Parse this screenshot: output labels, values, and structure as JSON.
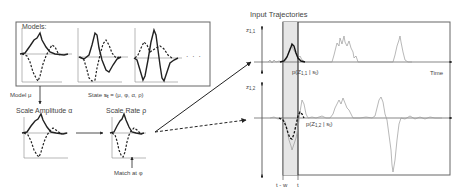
{
  "figure": {
    "type": "model-matching diagram",
    "models_box": {
      "title": "Models:",
      "ellipsis": "· · ·",
      "panels": [
        {
          "id": "model-1",
          "solid": "single positive peak",
          "dashed": "single negative trough with small positive bump"
        },
        {
          "id": "model-2",
          "solid": "positive peak then negative trough",
          "dashed": "negative trough then positive peak"
        },
        {
          "id": "model-3",
          "solid": "oscillating positive/negative peaks",
          "dashed": "broad positive hump"
        }
      ]
    },
    "labels": {
      "model_mu": "Model μ",
      "state": "State",
      "state_symbol": "s",
      "state_sub": "t",
      "state_tuple": "= (μ, φ, α, ρ)",
      "scale_amplitude": "Scale Amplitude α",
      "scale_rate": "Scale Rate ρ",
      "match_at": "Match at φ",
      "input_trajectories": "Input Trajectories",
      "time": "Time",
      "z11_main": "z",
      "z11_sub": "1,1",
      "z12_main": "z",
      "z12_sub": "1,2",
      "p11_pre": "p(Z",
      "p11_sub": "1,1",
      "p11_post": " | s",
      "p11_sub2": "t",
      "p11_end": ")",
      "p12_pre": "p(Z",
      "p12_sub": "1,2",
      "p12_post": " | s",
      "p12_sub2": "t",
      "p12_end": ")",
      "t_minus_w": "t - w",
      "t": "t"
    },
    "colors": {
      "line": "#222222",
      "trajectory": "#9a9a9a",
      "box": "#555555",
      "window_fill": "#e6e6e6"
    }
  }
}
